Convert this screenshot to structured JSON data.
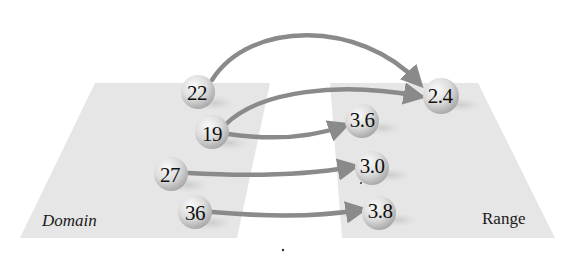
{
  "diagram": {
    "type": "function-mapping",
    "domain": {
      "label": "Domain",
      "values": [
        "22",
        "19",
        "27",
        "36"
      ]
    },
    "range": {
      "label": "Range",
      "values": [
        "2.4",
        "3.6",
        "3.0",
        "3.8"
      ]
    },
    "mappings": [
      {
        "from": "22",
        "to": "2.4"
      },
      {
        "from": "19",
        "to": "2.4"
      },
      {
        "from": "19",
        "to": "3.6"
      },
      {
        "from": "27",
        "to": "3.0"
      },
      {
        "from": "36",
        "to": "3.8"
      }
    ]
  },
  "colors": {
    "plane": "#e6e6e6",
    "ball_light": "#f4f4f4",
    "ball_dark": "#b5b5b5",
    "arrow": "#8a8a8a",
    "text": "#111111"
  }
}
